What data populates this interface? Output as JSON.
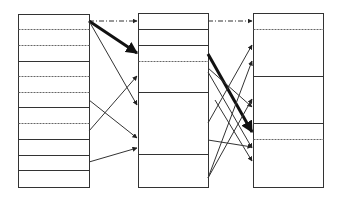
{
  "diagram": {
    "colors": {
      "stroke": "#333333",
      "background": "#ffffff"
    },
    "columns": [
      {
        "id": "left",
        "x": 18,
        "y": 14,
        "width": 71,
        "height": 173,
        "dividers": [
          {
            "y": 29,
            "style": "dashed"
          },
          {
            "y": 45,
            "style": "dashed"
          },
          {
            "y": 61,
            "style": "solid"
          },
          {
            "y": 76,
            "style": "dashed"
          },
          {
            "y": 92,
            "style": "dashed"
          },
          {
            "y": 107,
            "style": "solid"
          },
          {
            "y": 123,
            "style": "dashed"
          },
          {
            "y": 139,
            "style": "solid"
          },
          {
            "y": 155,
            "style": "solid"
          },
          {
            "y": 170,
            "style": "solid"
          }
        ]
      },
      {
        "id": "middle",
        "x": 138,
        "y": 13,
        "width": 70,
        "height": 174,
        "dividers": [
          {
            "y": 29,
            "style": "solid"
          },
          {
            "y": 45,
            "style": "solid"
          },
          {
            "y": 61,
            "style": "dashed"
          },
          {
            "y": 92,
            "style": "solid"
          },
          {
            "y": 154,
            "style": "solid"
          }
        ]
      },
      {
        "id": "right",
        "x": 253,
        "y": 13,
        "width": 70,
        "height": 174,
        "dividers": [
          {
            "y": 29,
            "style": "dashed"
          },
          {
            "y": 76,
            "style": "solid"
          },
          {
            "y": 123,
            "style": "solid"
          },
          {
            "y": 139,
            "style": "dashed"
          }
        ]
      }
    ],
    "arrows": [
      {
        "from": [
          89,
          21
        ],
        "to": [
          137,
          21
        ],
        "style": "dashdot",
        "weight": "thin"
      },
      {
        "from": [
          89,
          21
        ],
        "to": [
          137,
          53
        ],
        "style": "solid",
        "weight": "thick"
      },
      {
        "from": [
          89,
          21
        ],
        "to": [
          137,
          105
        ],
        "style": "solid",
        "weight": "thin"
      },
      {
        "from": [
          89,
          100
        ],
        "to": [
          137,
          138
        ],
        "style": "solid",
        "weight": "thin"
      },
      {
        "from": [
          89,
          131
        ],
        "to": [
          137,
          76
        ],
        "style": "solid",
        "weight": "thin"
      },
      {
        "from": [
          89,
          162
        ],
        "to": [
          137,
          148
        ],
        "style": "solid",
        "weight": "thin"
      },
      {
        "from": [
          208,
          21
        ],
        "to": [
          252,
          21
        ],
        "style": "dashdot",
        "weight": "thin"
      },
      {
        "from": [
          208,
          54
        ],
        "to": [
          252,
          132
        ],
        "style": "solid",
        "weight": "thick"
      },
      {
        "from": [
          208,
          68
        ],
        "to": [
          252,
          107
        ],
        "style": "solid",
        "weight": "thin"
      },
      {
        "from": [
          208,
          72
        ],
        "to": [
          252,
          148
        ],
        "style": "solid",
        "weight": "thin"
      },
      {
        "from": [
          208,
          123
        ],
        "to": [
          252,
          45
        ],
        "style": "solid",
        "weight": "thin"
      },
      {
        "from": [
          208,
          140
        ],
        "to": [
          252,
          147
        ],
        "style": "solid",
        "weight": "thin"
      },
      {
        "from": [
          208,
          178
        ],
        "to": [
          252,
          61
        ],
        "style": "solid",
        "weight": "thin"
      },
      {
        "from": [
          208,
          178
        ],
        "to": [
          252,
          99
        ],
        "style": "solid",
        "weight": "thin"
      },
      {
        "from": [
          215,
          100
        ],
        "to": [
          252,
          161
        ],
        "style": "solid",
        "weight": "thin"
      }
    ]
  }
}
